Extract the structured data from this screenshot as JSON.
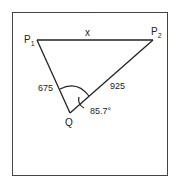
{
  "diagram": {
    "points": {
      "p1": {
        "label": "P",
        "sub": "1"
      },
      "p2": {
        "label": "P",
        "sub": "2"
      },
      "q": {
        "label": "Q"
      }
    },
    "edges": {
      "p1_p2": "x",
      "p1_q": "675",
      "q_p2": "925"
    },
    "angle": "85.7°"
  }
}
